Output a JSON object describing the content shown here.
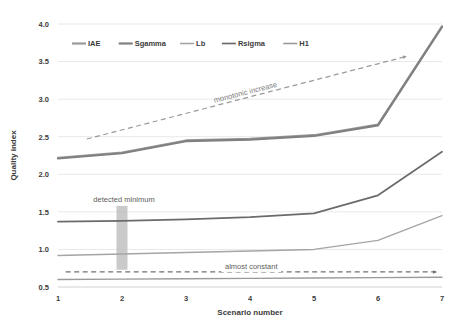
{
  "chart_data": {
    "type": "line",
    "title": "",
    "xlabel": "Scenario number",
    "ylabel": "Quality index",
    "x": [
      1,
      2,
      3,
      4,
      5,
      6,
      7
    ],
    "xlim": [
      1,
      7
    ],
    "ylim": [
      0.5,
      4.0
    ],
    "yticks": [
      "0.5",
      "1.0",
      "1.5",
      "2.0",
      "2.5",
      "3.0",
      "3.5",
      "4.0"
    ],
    "xticks": [
      "1",
      "2",
      "3",
      "4",
      "5",
      "6",
      "7"
    ],
    "grid": "horizontal",
    "legend_position": "top-left-inside",
    "series": [
      {
        "name": "IAE",
        "color": "#9a9a9a",
        "width": 2.2,
        "values": [
          2.22,
          2.29,
          2.45,
          2.47,
          2.52,
          2.66,
          3.97
        ]
      },
      {
        "name": "Sgamma",
        "color": "#808080",
        "width": 2.2,
        "values": [
          2.21,
          2.28,
          2.44,
          2.46,
          2.51,
          2.65,
          3.96
        ]
      },
      {
        "name": "Lb",
        "color": "#a5a5a5",
        "width": 1.4,
        "values": [
          0.92,
          0.94,
          0.96,
          0.98,
          1.0,
          1.12,
          1.45
        ]
      },
      {
        "name": "Rsigma",
        "color": "#6b6b6b",
        "width": 1.7,
        "values": [
          1.37,
          1.38,
          1.4,
          1.43,
          1.48,
          1.72,
          2.3
        ]
      },
      {
        "name": "H1",
        "color": "#9a9a9a",
        "width": 1.3,
        "values": [
          0.6,
          0.605,
          0.61,
          0.615,
          0.62,
          0.625,
          0.63
        ]
      }
    ],
    "annotations": [
      {
        "id": "monotonic-increase",
        "text": "monotonic increase",
        "style": "dashed-arrow",
        "rotated": true,
        "from_x": 1.45,
        "from_y": 2.47,
        "to_x": 6.45,
        "to_y": 3.57,
        "color": "#9a9a9a"
      },
      {
        "id": "almost-constant",
        "text": "almost constant",
        "style": "dashed-arrow",
        "rotated": false,
        "from_x": 1.12,
        "from_y": 0.7,
        "to_x": 6.92,
        "to_y": 0.7,
        "color": "#707070"
      },
      {
        "id": "detected-minimum",
        "text": "detected minimum",
        "style": "highlight-band",
        "band_x": 2,
        "band_y_from": 0.73,
        "band_y_to": 1.58,
        "color": "#b8b8b8"
      }
    ]
  },
  "legend": {
    "entries": [
      {
        "label": "IAE"
      },
      {
        "label": "Sgamma"
      },
      {
        "label": "Lb"
      },
      {
        "label": "Rsigma"
      },
      {
        "label": "H1"
      }
    ]
  },
  "axes": {
    "y_title": "Quality index",
    "x_title": "Scenario number"
  },
  "colors": {
    "grid": "#e8e8e8",
    "axis_line": "#d0d0d0",
    "text": "#3b3b3b",
    "annotation": "#8a8a8a",
    "band": "#bdbdbd"
  }
}
